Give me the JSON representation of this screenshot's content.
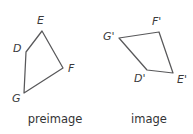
{
  "canvas": {
    "width": 193,
    "height": 134,
    "background": "#ffffff",
    "stroke_color": "#58585a",
    "label_color": "#3a3a3c",
    "caption_color": "#333335"
  },
  "figures": [
    {
      "id": "preimage",
      "caption": "preimage",
      "caption_x": 55,
      "caption_y": 115,
      "vertices": [
        {
          "name": "E",
          "label": "E",
          "x": 42,
          "y": 31,
          "label_x": 37,
          "label_y": 15
        },
        {
          "name": "F",
          "label": "F",
          "x": 63,
          "y": 68,
          "label_x": 68,
          "label_y": 63
        },
        {
          "name": "G",
          "label": "G",
          "x": 24,
          "y": 93,
          "label_x": 12,
          "label_y": 93
        },
        {
          "name": "D",
          "label": "D",
          "x": 26,
          "y": 52,
          "label_x": 13,
          "label_y": 43
        }
      ],
      "polygon_points": "42,31 63,68 24,93 26,52"
    },
    {
      "id": "image",
      "caption": "image",
      "caption_x": 148,
      "caption_y": 115,
      "vertices": [
        {
          "name": "F-prime",
          "label": "F'",
          "x": 159,
          "y": 32,
          "label_x": 152,
          "label_y": 16
        },
        {
          "name": "E-prime",
          "label": "E'",
          "x": 173,
          "y": 73,
          "label_x": 177,
          "label_y": 74
        },
        {
          "name": "D-prime",
          "label": "D'",
          "x": 147,
          "y": 70,
          "label_x": 134,
          "label_y": 73
        },
        {
          "name": "G-prime",
          "label": "G'",
          "x": 119,
          "y": 38,
          "label_x": 103,
          "label_y": 31
        }
      ],
      "polygon_points": "159,32 173,73 147,70 119,38"
    }
  ]
}
